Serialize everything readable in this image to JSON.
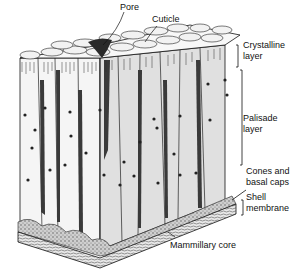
{
  "figure": {
    "labels": {
      "pore": "Pore",
      "cuticle": "Cuticle",
      "crystalline_layer": [
        "Crystalline",
        "layer"
      ],
      "palisade_layer": [
        "Palisade",
        "layer"
      ],
      "cones_basal_caps": [
        "Cones and",
        "basal caps"
      ],
      "shell_membrane": [
        "Shell",
        "membrane"
      ],
      "mammillary_core": "Mammillary core"
    },
    "colors": {
      "ink": "#111111",
      "column_light": "#f4f4f4",
      "column_shade": "#d9d9d9",
      "column_dark": "#3a3a3a",
      "background": "#ffffff"
    }
  }
}
